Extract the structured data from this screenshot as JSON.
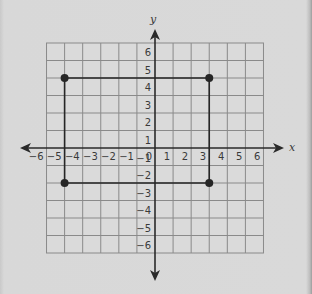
{
  "chart_data": {
    "type": "scatter",
    "title": "",
    "xlabel": "x",
    "ylabel": "y",
    "xlim": [
      -6,
      6
    ],
    "ylim": [
      -6,
      6
    ],
    "grid": true,
    "x_ticks": [
      -6,
      -5,
      -4,
      -3,
      -2,
      -1,
      0,
      1,
      2,
      3,
      4,
      5,
      6
    ],
    "y_ticks": [
      -6,
      -5,
      -4,
      -3,
      -2,
      -1,
      1,
      2,
      3,
      4,
      5,
      6
    ],
    "points": [
      {
        "x": -5,
        "y": 4
      },
      {
        "x": 3,
        "y": 4
      },
      {
        "x": 3,
        "y": -2
      },
      {
        "x": -5,
        "y": -2
      }
    ],
    "shape": "rectangle",
    "polygon": [
      [
        -5,
        4
      ],
      [
        3,
        4
      ],
      [
        3,
        -2
      ],
      [
        -5,
        -2
      ]
    ]
  },
  "labels": {
    "x_axis": "x",
    "y_axis": "y",
    "x_ticks": [
      "−6",
      "−5",
      "−4",
      "−3",
      "−2",
      "−1",
      "0",
      "1",
      "2",
      "3",
      "4",
      "5",
      "6"
    ],
    "y_ticks_pos": [
      "6",
      "5",
      "4",
      "3",
      "2",
      "1"
    ],
    "y_ticks_neg": [
      "−1",
      "−2",
      "−3",
      "−4",
      "−5",
      "−6"
    ]
  },
  "colors": {
    "background": "#d8d8d8",
    "grid": "#8a8a8a",
    "axis": "#2a2a2a",
    "shape": "#262626"
  }
}
